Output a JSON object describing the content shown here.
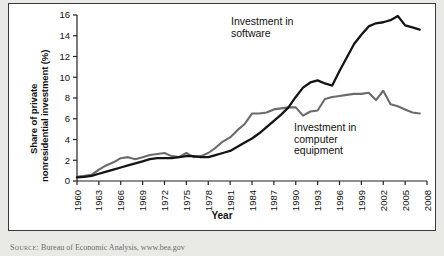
{
  "chart_data": {
    "type": "line",
    "title": "",
    "xlabel": "Year",
    "ylabel": "Share of private nonresidential investment (%)",
    "ylabel_line1": "Share of private",
    "ylabel_line2": "nonresidential investment (%)",
    "xlim": [
      1960,
      2008
    ],
    "ylim": [
      0,
      16
    ],
    "ytick_step": 2,
    "xtick_step": 3,
    "grid": false,
    "legend_position": "inline-annotations",
    "yticks": [
      0,
      2,
      4,
      6,
      8,
      10,
      12,
      14,
      16
    ],
    "xticks": [
      1960,
      1963,
      1966,
      1969,
      1972,
      1975,
      1978,
      1981,
      1984,
      1987,
      1990,
      1993,
      1996,
      1999,
      2002,
      2005,
      2008
    ],
    "x": [
      1960,
      1961,
      1962,
      1963,
      1964,
      1965,
      1966,
      1967,
      1968,
      1969,
      1970,
      1971,
      1972,
      1973,
      1974,
      1975,
      1976,
      1977,
      1978,
      1979,
      1980,
      1981,
      1982,
      1983,
      1984,
      1985,
      1986,
      1987,
      1988,
      1989,
      1990,
      1991,
      1992,
      1993,
      1994,
      1995,
      1996,
      1997,
      1998,
      1999,
      2000,
      2001,
      2002,
      2003,
      2004,
      2005,
      2006,
      2007
    ],
    "series": [
      {
        "name": "Investment in computer equipment",
        "color": "#6b6b6b",
        "annotation": "Investment in\ncomputer\nequipment",
        "values": [
          0.4,
          0.5,
          0.6,
          1.1,
          1.5,
          1.8,
          2.2,
          2.3,
          2.1,
          2.3,
          2.5,
          2.6,
          2.7,
          2.4,
          2.3,
          2.7,
          2.3,
          2.4,
          2.7,
          3.2,
          3.8,
          4.2,
          4.9,
          5.5,
          6.5,
          6.5,
          6.6,
          6.9,
          7.0,
          7.1,
          7.1,
          6.3,
          6.7,
          6.8,
          7.9,
          8.1,
          8.2,
          8.3,
          8.4,
          8.4,
          8.5,
          7.8,
          8.7,
          7.4,
          7.2,
          6.9,
          6.6,
          6.5
        ]
      },
      {
        "name": "Investment in software",
        "color": "#141414",
        "annotation": "Investment in\nsoftware",
        "values": [
          0.35,
          0.4,
          0.5,
          0.7,
          0.9,
          1.1,
          1.3,
          1.5,
          1.7,
          1.9,
          2.1,
          2.2,
          2.2,
          2.2,
          2.3,
          2.4,
          2.4,
          2.3,
          2.3,
          2.5,
          2.7,
          2.9,
          3.3,
          3.7,
          4.1,
          4.6,
          5.2,
          5.8,
          6.4,
          7.1,
          8.1,
          9.0,
          9.5,
          9.7,
          9.4,
          9.2,
          10.6,
          11.9,
          13.2,
          14.1,
          14.9,
          15.2,
          15.3,
          15.5,
          15.9,
          15.0,
          14.8,
          14.6
        ]
      }
    ]
  },
  "source": {
    "prefix": "Source:",
    "text": "Bureau of Economic Analysis, www.bea.gov"
  }
}
